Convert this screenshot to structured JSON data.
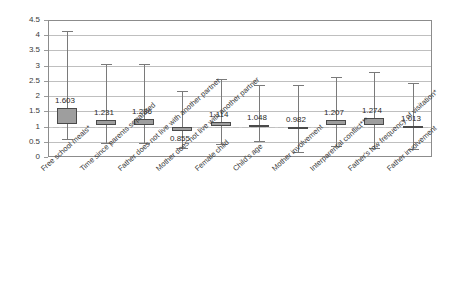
{
  "chart_data": {
    "type": "box",
    "title": "",
    "xlabel": "",
    "ylabel": "",
    "ylim": [
      0,
      4.5
    ],
    "ytick_step": 0.5,
    "grid": true,
    "legend": "none",
    "yticks": [
      "0",
      "0.5",
      "1",
      "1.5",
      "2",
      "2.5",
      "3",
      "3.5",
      "4",
      "4.5"
    ],
    "reference_line": 1,
    "categories": [
      "Free school meals*",
      "Time since parents separated",
      "Father does not live with another partner",
      "Mother does not live with another partner",
      "Female child",
      "Child's age",
      "Mother involvement",
      "Interparental conflict***",
      "Father's low frequency of visitation*",
      "Father involvement"
    ],
    "boxes": [
      {
        "label": "Free school meals*",
        "value": 1.603,
        "point": 1.603,
        "box_low": 1.1,
        "box_high": 1.6,
        "whisker_low": 0.58,
        "whisker_high": 4.14,
        "label_text": "1.603"
      },
      {
        "label": "Time since parents separated",
        "value": 1.231,
        "point": 1.231,
        "box_low": 1.05,
        "box_high": 1.23,
        "whisker_low": 0.46,
        "whisker_high": 3.06,
        "label_text": "1.231"
      },
      {
        "label": "Father does not live with another partner",
        "value": 1.236,
        "point": 1.236,
        "box_low": 1.05,
        "box_high": 1.24,
        "whisker_low": 0.45,
        "whisker_high": 3.05,
        "label_text": "1.236"
      },
      {
        "label": "Mother does not live with another partner",
        "value": 0.855,
        "point": 0.855,
        "box_low": 0.84,
        "box_high": 0.97,
        "whisker_low": 0.3,
        "whisker_high": 2.17,
        "label_text": "0.855"
      },
      {
        "label": "Female child",
        "value": 1.114,
        "point": 1.114,
        "box_low": 1.02,
        "box_high": 1.14,
        "whisker_low": 0.42,
        "whisker_high": 2.57,
        "label_text": "1.114"
      },
      {
        "label": "Child's age",
        "value": 1.048,
        "point": 1.048,
        "box_low": 1.02,
        "box_high": 1.06,
        "whisker_low": 0.53,
        "whisker_high": 2.37,
        "label_text": "1.048"
      },
      {
        "label": "Mother involvement",
        "value": 0.982,
        "point": 0.982,
        "box_low": 0.96,
        "box_high": 1.0,
        "whisker_low": 0.18,
        "whisker_high": 2.35,
        "label_text": "0.982"
      },
      {
        "label": "Interparental conflict***",
        "value": 1.207,
        "point": 1.207,
        "box_low": 1.06,
        "box_high": 1.21,
        "whisker_low": 0.36,
        "whisker_high": 2.62,
        "label_text": "1.207"
      },
      {
        "label": "Father's low frequency of visitation*",
        "value": 1.274,
        "point": 1.274,
        "box_low": 1.06,
        "box_high": 1.27,
        "whisker_low": 0.29,
        "whisker_high": 2.78,
        "label_text": "1.274"
      },
      {
        "label": "Father involvement",
        "value": 1.013,
        "point": 1.013,
        "box_low": 1.0,
        "box_high": 1.02,
        "whisker_low": 0.27,
        "whisker_high": 2.42,
        "label_text": "1.013"
      }
    ]
  },
  "colors": {
    "box_fill": "#9e9e9e",
    "box_border": "#4a4a4a",
    "whisker": "#7a7a7a",
    "gridline": "#bfbfbf",
    "frame": "#8c8c8c",
    "text": "#3a3a3a",
    "background": "#ffffff"
  }
}
